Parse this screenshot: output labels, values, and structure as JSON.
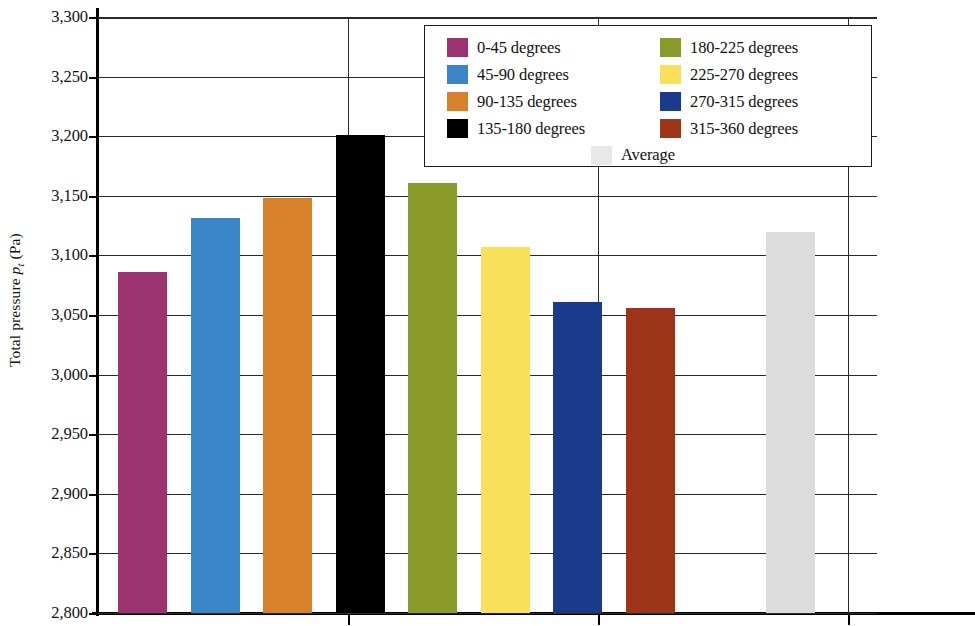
{
  "chart_data": {
    "type": "bar",
    "title": "",
    "xlabel": "",
    "ylabel": "Total pressure p_t (Pa)",
    "ylim": [
      2800,
      3300
    ],
    "ytick_step": 50,
    "grid": true,
    "legend_position": "top-right-inside",
    "categories": [
      "0-45 degrees",
      "45-90 degrees",
      "90-135 degrees",
      "135-180 degrees",
      "180-225 degrees",
      "225-270 degrees",
      "270-315 degrees",
      "315-360 degrees",
      "Average"
    ],
    "values": [
      3086,
      3131,
      3148,
      3201,
      3161,
      3107,
      3061,
      3056,
      3120
    ],
    "colors": [
      "#9B3272",
      "#3A86C8",
      "#D8812B",
      "#000000",
      "#8A9A28",
      "#F8E05B",
      "#1B3A8C",
      "#9E3418",
      "#DCDCDC"
    ],
    "ytick_labels": [
      "3,300",
      "3,250",
      "3,200",
      "3,150",
      "3,100",
      "3,050",
      "3,000",
      "2,950",
      "2,900",
      "2,850",
      "2,800"
    ],
    "ytick_values": [
      3300,
      3250,
      3200,
      3150,
      3100,
      3050,
      3000,
      2950,
      2900,
      2850,
      2800
    ]
  },
  "axis": {
    "y_title_prefix": "Total pressure ",
    "y_title_symbol": "p",
    "y_title_subscript": "t",
    "y_title_suffix": " (Pa)"
  },
  "legend": {
    "column_left": [
      {
        "label": "0-45 degrees",
        "color": "#9B3272"
      },
      {
        "label": "45-90 degrees",
        "color": "#3A86C8"
      },
      {
        "label": "90-135 degrees",
        "color": "#D8812B"
      },
      {
        "label": "135-180 degrees",
        "color": "#000000"
      }
    ],
    "column_right": [
      {
        "label": "180-225 degrees",
        "color": "#8A9A28"
      },
      {
        "label": "225-270 degrees",
        "color": "#F8E05B"
      },
      {
        "label": "270-315 degrees",
        "color": "#1B3A8C"
      },
      {
        "label": "315-360 degrees",
        "color": "#9E3418"
      }
    ],
    "average": {
      "label": "Average",
      "color": "#E8E8E8"
    }
  }
}
